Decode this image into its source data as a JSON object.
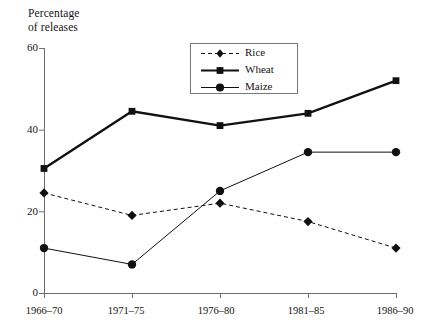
{
  "chart_data": {
    "type": "line",
    "title": "",
    "ylabel": "Percentage\nof releases",
    "xlabel": "",
    "categories": [
      "1966–70",
      "1971–75",
      "1976–80",
      "1981–85",
      "1986–90"
    ],
    "yticks": [
      0,
      20,
      40,
      60
    ],
    "ylim": [
      0,
      60
    ],
    "grid": false,
    "legend_position": "top-center",
    "series": [
      {
        "name": "Rice",
        "marker": "diamond",
        "line_style": "dashed",
        "color": "#111111",
        "values": [
          24.5,
          19.0,
          22.0,
          17.5,
          11.0
        ]
      },
      {
        "name": "Wheat",
        "marker": "square",
        "line_style": "solid-thick",
        "color": "#111111",
        "values": [
          30.5,
          44.5,
          41.0,
          44.0,
          52.0
        ]
      },
      {
        "name": "Maize",
        "marker": "circle",
        "line_style": "solid-thin",
        "color": "#111111",
        "values": [
          11.0,
          7.0,
          25.0,
          34.5,
          34.5
        ]
      }
    ]
  },
  "axis": {
    "y_title": "Percentage\nof releases",
    "y_tick_labels": [
      "60",
      "40",
      "20",
      "0"
    ],
    "x_tick_labels": [
      "1966–70",
      "1971–75",
      "1976–80",
      "1981–85",
      "1986–90"
    ]
  },
  "legend": {
    "entries": [
      {
        "label": "Rice"
      },
      {
        "label": "Wheat"
      },
      {
        "label": "Maize"
      }
    ]
  },
  "colors": {
    "ink": "#111111",
    "axis": "#6e6e6e",
    "legend_border": "#777777",
    "background": "#ffffff"
  }
}
